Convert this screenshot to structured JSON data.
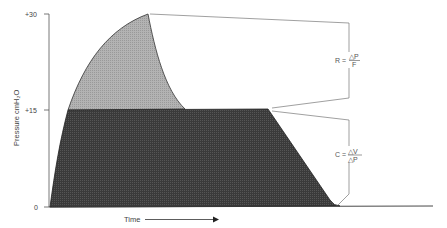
{
  "diagram": {
    "y_axis": {
      "title": "Pressure  cmH₂O",
      "ticks": [
        {
          "label": "+30",
          "value": 30
        },
        {
          "label": "+15",
          "value": 15
        },
        {
          "label": "0",
          "value": 0
        }
      ]
    },
    "x_axis": {
      "title": "Time"
    },
    "regions": {
      "resistance_area_color": "#b0b0b0",
      "compliance_area_color": "#3a3a3a"
    },
    "annotations": {
      "resistance": {
        "lhs": "R =",
        "numerator": "△P",
        "denominator": "F"
      },
      "compliance": {
        "lhs": "C =",
        "numerator": "△V",
        "denominator": "△P"
      }
    },
    "values": {
      "peak_pressure": 30,
      "plateau_pressure": 15,
      "baseline": 0
    }
  }
}
